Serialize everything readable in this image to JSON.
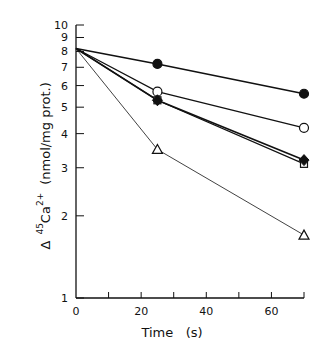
{
  "chart_data": {
    "type": "line",
    "title": "",
    "xlabel": "Time   (s)",
    "ylabel": {
      "prefix": "Δ",
      "isotope": "45",
      "element": "Ca",
      "charge": "2+",
      "units": "(nmol/mg prot.)"
    },
    "xlim": [
      0,
      70
    ],
    "ylim": [
      1,
      10
    ],
    "yscale": "log",
    "grid": false,
    "legend": "none",
    "x_ticks": [
      0,
      10,
      20,
      30,
      40,
      50,
      60,
      70
    ],
    "x_tick_labels": [
      "0",
      "",
      "20",
      "",
      "40",
      "",
      "60",
      ""
    ],
    "y_ticks": [
      1,
      2,
      3,
      4,
      5,
      6,
      7,
      8,
      9,
      10
    ],
    "y_tick_labels": [
      "1",
      "2",
      "3",
      "4",
      "5",
      "6",
      "7",
      "8",
      "9",
      "10"
    ],
    "x": [
      0,
      25,
      70
    ],
    "series": [
      {
        "name": "filled-circle",
        "marker": "circle",
        "filled": true,
        "line_weight": "thick",
        "values": [
          8.2,
          7.2,
          5.6
        ]
      },
      {
        "name": "open-circle",
        "marker": "circle",
        "filled": false,
        "line_weight": "medium",
        "values": [
          8.2,
          5.7,
          4.2
        ]
      },
      {
        "name": "open-square",
        "marker": "square",
        "filled": false,
        "line_weight": "medium",
        "values": [
          8.2,
          5.3,
          3.1
        ]
      },
      {
        "name": "filled-diamond",
        "marker": "diamond",
        "filled": true,
        "line_weight": "thick",
        "values": [
          8.2,
          5.3,
          3.2
        ]
      },
      {
        "name": "open-triangle",
        "marker": "triangle",
        "filled": false,
        "line_weight": "thin",
        "values": [
          8.2,
          3.5,
          1.7
        ]
      }
    ]
  }
}
